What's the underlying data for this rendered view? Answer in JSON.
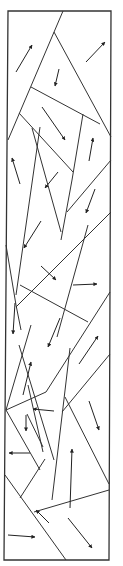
{
  "diagram": {
    "title": "",
    "width": 123,
    "height": 566,
    "colors": {
      "line": "#333333",
      "arrow": "#222222",
      "background": "#ffffff"
    },
    "frame": [
      [
        8,
        11
      ],
      [
        111,
        11
      ],
      [
        109,
        560
      ],
      [
        4,
        560
      ]
    ],
    "edges": [
      [
        [
          63,
          11
        ],
        [
          8,
          140
        ]
      ],
      [
        [
          54,
          32
        ],
        [
          111,
          137
        ]
      ],
      [
        [
          31,
          87
        ],
        [
          100,
          124
        ]
      ],
      [
        [
          19,
          113
        ],
        [
          73,
          172
        ]
      ],
      [
        [
          83,
          114
        ],
        [
          72,
          180
        ],
        [
          61,
          240
        ]
      ],
      [
        [
          111,
          160
        ],
        [
          67,
          212
        ]
      ],
      [
        [
          40,
          127
        ],
        [
          16,
          295
        ]
      ],
      [
        [
          32,
          128
        ],
        [
          61,
          232
        ]
      ],
      [
        [
          111,
          212
        ],
        [
          16,
          307
        ]
      ],
      [
        [
          6,
          245
        ],
        [
          16,
          305
        ],
        [
          21,
          330
        ]
      ],
      [
        [
          88,
          225
        ],
        [
          57,
          337
        ]
      ],
      [
        [
          20,
          285
        ],
        [
          88,
          322
        ]
      ],
      [
        [
          110,
          292
        ],
        [
          46,
          392
        ],
        [
          6,
          410
        ]
      ],
      [
        [
          31,
          325
        ],
        [
          6,
          410
        ]
      ],
      [
        [
          70,
          348
        ],
        [
          62,
          416
        ],
        [
          52,
          500
        ]
      ],
      [
        [
          19,
          345
        ],
        [
          54,
          460
        ]
      ],
      [
        [
          110,
          354
        ],
        [
          62,
          412
        ]
      ],
      [
        [
          65,
          397
        ],
        [
          109,
          484
        ]
      ],
      [
        [
          6,
          410
        ],
        [
          40,
          470
        ]
      ],
      [
        [
          28,
          385
        ],
        [
          43,
          452
        ]
      ],
      [
        [
          27,
          414
        ],
        [
          43,
          447
        ]
      ],
      [
        [
          45,
          459
        ],
        [
          20,
          498
        ]
      ],
      [
        [
          109,
          490
        ],
        [
          34,
          512
        ]
      ],
      [
        [
          5,
          475
        ],
        [
          66,
          560
        ]
      ]
    ],
    "arrows": [
      {
        "from": [
          16,
          72
        ],
        "to": [
          32,
          45
        ],
        "name": "arrow-up-right-1"
      },
      {
        "from": [
          86,
          62
        ],
        "to": [
          105,
          42
        ],
        "name": "arrow-up-right-2"
      },
      {
        "from": [
          59,
          69
        ],
        "to": [
          55,
          86
        ],
        "name": "arrow-down-1"
      },
      {
        "from": [
          42,
          107
        ],
        "to": [
          65,
          140
        ],
        "name": "arrow-down-right-1"
      },
      {
        "from": [
          89,
          161
        ],
        "to": [
          93,
          138
        ],
        "name": "arrow-up-2"
      },
      {
        "from": [
          20,
          184
        ],
        "to": [
          12,
          158
        ],
        "name": "arrow-up-left-1"
      },
      {
        "from": [
          58,
          172
        ],
        "to": [
          45,
          188
        ],
        "name": "arrow-down-left-1"
      },
      {
        "from": [
          95,
          189
        ],
        "to": [
          86,
          213
        ],
        "name": "arrow-down-2"
      },
      {
        "from": [
          41,
          221
        ],
        "to": [
          24,
          248
        ],
        "name": "arrow-down-left-2"
      },
      {
        "from": [
          41,
          266
        ],
        "to": [
          56,
          280
        ],
        "name": "arrow-down-right-2"
      },
      {
        "from": [
          73,
          285
        ],
        "to": [
          97,
          284
        ],
        "name": "arrow-right-1"
      },
      {
        "from": [
          15,
          303
        ],
        "to": [
          13,
          334
        ],
        "name": "arrow-down-3"
      },
      {
        "from": [
          60,
          318
        ],
        "to": [
          48,
          347
        ],
        "name": "arrow-down-left-3"
      },
      {
        "from": [
          79,
          364
        ],
        "to": [
          98,
          336
        ],
        "name": "arrow-up-right-3"
      },
      {
        "from": [
          23,
          395
        ],
        "to": [
          31,
          362
        ],
        "name": "arrow-up-3"
      },
      {
        "from": [
          54,
          411
        ],
        "to": [
          33,
          409
        ],
        "name": "arrow-left-1"
      },
      {
        "from": [
          26,
          415
        ],
        "to": [
          26,
          431
        ],
        "name": "arrow-down-4"
      },
      {
        "from": [
          89,
          401
        ],
        "to": [
          99,
          430
        ],
        "name": "arrow-down-4b"
      },
      {
        "from": [
          30,
          453
        ],
        "to": [
          9,
          453
        ],
        "name": "arrow-left-2"
      },
      {
        "from": [
          70,
          508
        ],
        "to": [
          72,
          449
        ],
        "name": "arrow-up-4"
      },
      {
        "from": [
          49,
          523
        ],
        "to": [
          36,
          510
        ],
        "name": "arrow-up-left-2"
      },
      {
        "from": [
          8,
          535
        ],
        "to": [
          35,
          537
        ],
        "name": "arrow-right-2"
      },
      {
        "from": [
          68,
          518
        ],
        "to": [
          92,
          548
        ],
        "name": "arrow-down-right-3"
      }
    ]
  }
}
